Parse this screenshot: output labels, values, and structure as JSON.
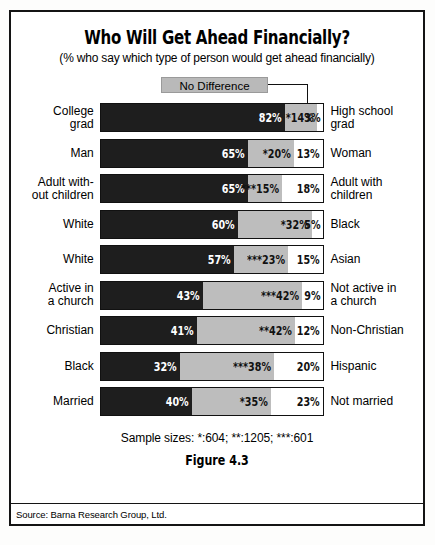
{
  "figure": {
    "title": "Who Will Get Ahead Financially?",
    "subtitle": "(% who say which type of person would get ahead financially)",
    "legend_label": "No Difference",
    "sample_sizes": "Sample sizes:  *:604;  **:1205;  ***:601",
    "figure_number": "Figure 4.3",
    "source": "Source: Barna Research Group, Ltd."
  },
  "chart_data": {
    "type": "bar",
    "subtype": "stacked-horizontal-100",
    "title": "Who Will Get Ahead Financially?",
    "subtitle": "(% who say which type of person would get ahead financially)",
    "xlabel": "",
    "ylabel": "",
    "xlim": [
      0,
      100
    ],
    "grid": false,
    "legend_position": "top-center",
    "series": [
      {
        "name": "Left group",
        "color": "#1e1e1e"
      },
      {
        "name": "No Difference",
        "color": "#bdbdbd"
      },
      {
        "name": "Right group",
        "color": "#ffffff"
      }
    ],
    "rows": [
      {
        "left_label": "College grad",
        "left_label_lines": [
          "College",
          "grad"
        ],
        "right_label": "High school grad",
        "right_label_lines": [
          "High school",
          "grad"
        ],
        "values": [
          82,
          14,
          3
        ],
        "display": [
          "82%",
          "*14%",
          "3%"
        ]
      },
      {
        "left_label": "Man",
        "left_label_lines": [
          "Man"
        ],
        "right_label": "Woman",
        "right_label_lines": [
          "Woman"
        ],
        "values": [
          65,
          20,
          13
        ],
        "display": [
          "65%",
          "*20%",
          "13%"
        ]
      },
      {
        "left_label": "Adult without children",
        "left_label_lines": [
          "Adult with-",
          "out children"
        ],
        "right_label": "Adult with children",
        "right_label_lines": [
          "Adult with",
          "children"
        ],
        "values": [
          65,
          15,
          18
        ],
        "display": [
          "65%",
          "***15%",
          "18%"
        ]
      },
      {
        "left_label": "White",
        "left_label_lines": [
          "White"
        ],
        "right_label": "Black",
        "right_label_lines": [
          "Black"
        ],
        "values": [
          60,
          32,
          5
        ],
        "display": [
          "60%",
          "*32%",
          "5%"
        ]
      },
      {
        "left_label": "White",
        "left_label_lines": [
          "White"
        ],
        "right_label": "Asian",
        "right_label_lines": [
          "Asian"
        ],
        "values": [
          57,
          23,
          15
        ],
        "display": [
          "57%",
          "***23%",
          "15%"
        ]
      },
      {
        "left_label": "Active in a church",
        "left_label_lines": [
          "Active in",
          "a church"
        ],
        "right_label": "Not active in a church",
        "right_label_lines": [
          "Not active in",
          "a church"
        ],
        "values": [
          43,
          42,
          9
        ],
        "display": [
          "43%",
          "***42%",
          "9%"
        ]
      },
      {
        "left_label": "Christian",
        "left_label_lines": [
          "Christian"
        ],
        "right_label": "Non-Christian",
        "right_label_lines": [
          "Non-Christian"
        ],
        "values": [
          41,
          42,
          12
        ],
        "display": [
          "41%",
          "**42%",
          "12%"
        ]
      },
      {
        "left_label": "Black",
        "left_label_lines": [
          "Black"
        ],
        "right_label": "Hispanic",
        "right_label_lines": [
          "Hispanic"
        ],
        "values": [
          32,
          38,
          20
        ],
        "display": [
          "32%",
          "***38%",
          "20%"
        ]
      },
      {
        "left_label": "Married",
        "left_label_lines": [
          "Married"
        ],
        "right_label": "Not married",
        "right_label_lines": [
          "Not married"
        ],
        "values": [
          40,
          35,
          23
        ],
        "display": [
          "40%",
          "*35%",
          "23%"
        ]
      }
    ]
  }
}
